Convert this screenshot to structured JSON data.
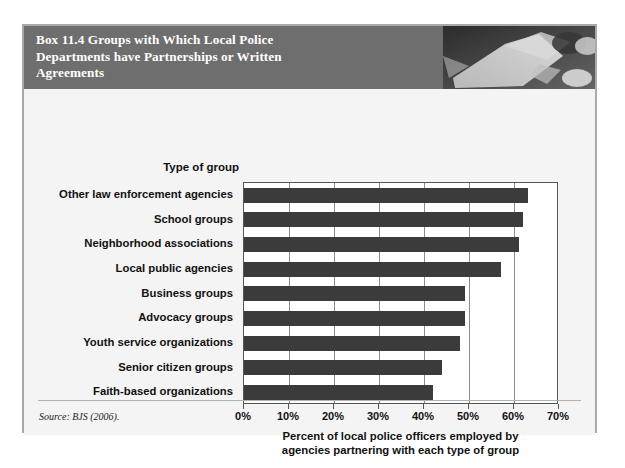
{
  "box": {
    "title": "Box 11.4  Groups with Which Local Police\nDepartments have Partnerships or Written\nAgreements",
    "photo_alt": "police-photo",
    "source_note": "Source: BJS (2006)."
  },
  "chart_data": {
    "type": "bar",
    "orientation": "horizontal",
    "title": "Box 11.4  Groups with Which Local Police Departments have Partnerships or Written Agreements",
    "ylabel": "Type of group",
    "xlabel": "Percent of local police officers employed by\nagencies partnering with each type of group",
    "categories": [
      "Other law enforcement agencies",
      "School groups",
      "Neighborhood associations",
      "Local public agencies",
      "Business groups",
      "Advocacy groups",
      "Youth service organizations",
      "Senior citizen groups",
      "Faith-based organizations"
    ],
    "values": [
      63,
      62,
      61,
      57,
      49,
      49,
      48,
      44,
      42
    ],
    "xlim": [
      0,
      70
    ],
    "xticks": [
      0,
      10,
      20,
      30,
      40,
      50,
      60,
      70
    ],
    "xtick_labels": [
      "0%",
      "10%",
      "20%",
      "30%",
      "40%",
      "50%",
      "60%",
      "70%"
    ],
    "grid": true,
    "legend": false,
    "bar_color": "#3b3b3b",
    "plot_background": "#ffffff",
    "panel_background": "#f4f4f4",
    "header_background": "#6e6e6e"
  }
}
